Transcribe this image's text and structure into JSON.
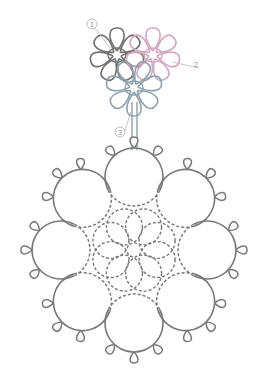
{
  "diagram": {
    "colors": {
      "background": "#ffffff",
      "thread_main": "#7a7a7a",
      "thread_motif_1": "#707070",
      "thread_motif_2": "#d3a7c3",
      "thread_motif_3": "#8ea1ad",
      "label": "#9a9a9a"
    },
    "labels": [
      {
        "id": "1",
        "text": "1",
        "x": 92,
        "y": 24,
        "circled": true,
        "leader_to": [
          110,
          48
        ]
      },
      {
        "id": "2",
        "text": "2",
        "x": 196,
        "y": 64,
        "circled": false,
        "leader_to": [
          172,
          62
        ]
      },
      {
        "id": "3",
        "text": "3",
        "x": 120,
        "y": 132,
        "circled": true,
        "leader_to": [
          131,
          112
        ]
      }
    ],
    "motifs": [
      {
        "id": "1",
        "color_key": "thread_motif_1",
        "cx": 117,
        "cy": 55,
        "loops": 7,
        "loop_len": 23,
        "loop_w": 10,
        "start_angle": -90
      },
      {
        "id": "2",
        "color_key": "thread_motif_2",
        "cx": 153,
        "cy": 55,
        "loops": 7,
        "loop_len": 23,
        "loop_w": 10,
        "start_angle": -90
      },
      {
        "id": "3",
        "color_key": "thread_motif_3",
        "cx": 134,
        "cy": 88,
        "loops": 7,
        "loop_len": 24,
        "loop_w": 10,
        "start_angle": 90
      }
    ],
    "stem": {
      "x1": 132,
      "x2": 137,
      "y_top": 102,
      "y_bottom": 150
    },
    "medallion": {
      "cx": 134,
      "cy": 250,
      "ring_radius": 73,
      "circle_count": 8,
      "circle_radius": 29,
      "picots_per_circle": 3,
      "picot_len": 11,
      "inner_petal_count": 8,
      "inner_petal_radius": 18,
      "inner_petal_distance": 25
    }
  }
}
